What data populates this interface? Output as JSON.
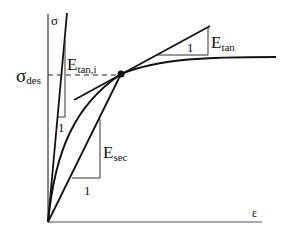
{
  "diagram": {
    "labels": {
      "y_axis": "σ",
      "x_axis": "ε",
      "sigma_des_main": "σ",
      "sigma_des_sub": "des",
      "e_tan_i_main": "E",
      "e_tan_i_sub": "tan,i",
      "e_tan_main": "E",
      "e_tan_sub": "tan",
      "e_sec_main": "E",
      "e_sec_sub": "sec",
      "unit_tan_i": "1",
      "unit_tan": "1",
      "unit_sec": "1"
    },
    "colors": {
      "line": "#111111",
      "axis": "#333333",
      "background": "#ffffff"
    }
  }
}
